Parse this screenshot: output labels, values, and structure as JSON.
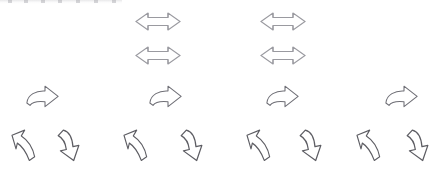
{
  "figure": {
    "background_color": "#ffffff",
    "width": 439,
    "height": 172,
    "stroke_color_light": "#9a9aa0",
    "stroke_color_dark": "#5d5d63",
    "fill_color": "#ffffff"
  },
  "top_artifact": {
    "name": "cropped-edge-artifact",
    "visible": true,
    "description": "faint cut-off gray strip at very top-left"
  },
  "rows": [
    {
      "id": "row-1",
      "label": "Row 1 — double-headed horizontal arrows",
      "glyph_type": "double-headed-horizontal-arrow",
      "count": 2,
      "y": 10,
      "glyph_width": 48,
      "glyph_height": 23,
      "x_positions": [
        134,
        259
      ],
      "stroke": "#9a9aa0"
    },
    {
      "id": "row-2",
      "label": "Row 2 — double-headed horizontal arrows",
      "glyph_type": "double-headed-horizontal-arrow",
      "count": 2,
      "y": 44,
      "glyph_width": 48,
      "glyph_height": 23,
      "x_positions": [
        134,
        259
      ],
      "stroke": "#9a9aa0"
    },
    {
      "id": "row-3",
      "label": "Row 3 — curved right-pointing arrows",
      "glyph_type": "curved-right-arrow",
      "count": 4,
      "y": 85,
      "glyph_width": 35,
      "glyph_height": 24,
      "x_positions": [
        25,
        148,
        265,
        384
      ],
      "stroke": "#6f6f76"
    },
    {
      "id": "row-4",
      "label": "Row 4 — alternating up-left and down curved arrows",
      "glyph_type": "alternating",
      "count": 8,
      "y": 128,
      "glyph_width": 28,
      "glyph_height": 36,
      "items": [
        {
          "x": 10,
          "kind": "curved-up-left-arrow"
        },
        {
          "x": 56,
          "kind": "curved-down-arrow"
        },
        {
          "x": 122,
          "kind": "curved-up-left-arrow"
        },
        {
          "x": 179,
          "kind": "curved-down-arrow"
        },
        {
          "x": 245,
          "kind": "curved-up-left-arrow"
        },
        {
          "x": 298,
          "kind": "curved-down-arrow"
        },
        {
          "x": 355,
          "kind": "curved-up-left-arrow"
        },
        {
          "x": 405,
          "kind": "curved-down-arrow"
        }
      ],
      "stroke": "#5d5d63"
    }
  ]
}
